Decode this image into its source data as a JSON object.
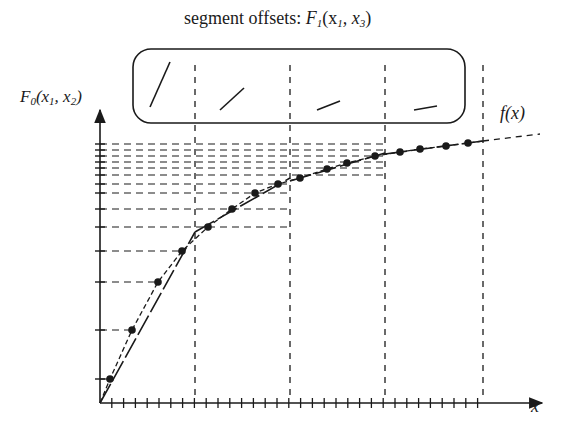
{
  "title": {
    "prefix": "segment offsets: ",
    "fn": "F",
    "fn_sub": "1",
    "args": "(x",
    "arg1_sub": "1",
    "sep": ", x",
    "arg2_sub": "3",
    "close": ")"
  },
  "y_axis_label": {
    "fn": "F",
    "fn_sub": "0",
    "open": "(x",
    "a_sub": "1",
    "sep": ", x",
    "b_sub": "2",
    "close": ")"
  },
  "curve_label": "f(x)",
  "x_axis_label": "x",
  "colors": {
    "ink": "#1a1a1a",
    "background": "#ffffff"
  },
  "geometry": {
    "origin": [
      100,
      403
    ],
    "x_axis_end": 542,
    "y_axis_top": 110,
    "segment_boundaries_x": [
      195,
      290,
      385,
      483
    ],
    "x_tick_spacing": 11.8,
    "x_tick_count": 32,
    "y_ticks": [
      379,
      330,
      282,
      251,
      227,
      209,
      193,
      184,
      175,
      168,
      162,
      156,
      150,
      144
    ],
    "offsets_box": {
      "x": 133,
      "y": 49,
      "w": 332,
      "h": 74,
      "r": 18
    }
  },
  "segments": [
    {
      "x0": 100,
      "x1": 195,
      "dots": [
        [
          110,
          379
        ],
        [
          132,
          330
        ],
        [
          158,
          282
        ],
        [
          182,
          251
        ]
      ],
      "line": [
        [
          100,
          403
        ],
        [
          195,
          232
        ]
      ],
      "offset_glyph": [
        [
          150,
          107
        ],
        [
          170,
          62
        ]
      ]
    },
    {
      "x0": 195,
      "x1": 290,
      "dots": [
        [
          208,
          227
        ],
        [
          232,
          209
        ],
        [
          255,
          193
        ],
        [
          278,
          184
        ]
      ],
      "line": [
        [
          195,
          232
        ],
        [
          290,
          178
        ]
      ],
      "offset_glyph": [
        [
          220,
          110
        ],
        [
          244,
          88
        ]
      ]
    },
    {
      "x0": 290,
      "x1": 385,
      "dots": [
        [
          300,
          178
        ],
        [
          327,
          169
        ],
        [
          347,
          163
        ],
        [
          375,
          156
        ]
      ],
      "line": [
        [
          290,
          181
        ],
        [
          385,
          153
        ]
      ],
      "offset_glyph": [
        [
          317,
          110
        ],
        [
          340,
          101
        ]
      ]
    },
    {
      "x0": 385,
      "x1": 483,
      "dots": [
        [
          400,
          152
        ],
        [
          420,
          149
        ],
        [
          446,
          146
        ],
        [
          468,
          143
        ]
      ],
      "line": [
        [
          385,
          154
        ],
        [
          483,
          141
        ]
      ],
      "offset_glyph": [
        [
          414,
          110
        ],
        [
          437,
          106
        ]
      ]
    }
  ],
  "curve_tail": [
    [
      483,
      141
    ],
    [
      540,
      134
    ]
  ]
}
